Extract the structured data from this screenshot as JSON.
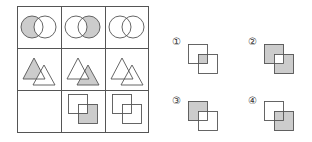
{
  "puzzle": {
    "description": "3x3 figure reasoning grid with four answer options",
    "grid": {
      "rows": 3,
      "cols": 3,
      "cells": [
        {
          "row": 1,
          "col": 1,
          "shape": "circles",
          "shaded": "left-minus-overlap"
        },
        {
          "row": 1,
          "col": 2,
          "shape": "circles",
          "shaded": "right-minus-overlap"
        },
        {
          "row": 1,
          "col": 3,
          "shape": "circles",
          "shaded": "none"
        },
        {
          "row": 2,
          "col": 1,
          "shape": "triangles",
          "shaded": "left-minus-overlap"
        },
        {
          "row": 2,
          "col": 2,
          "shape": "triangles",
          "shaded": "right-minus-overlap"
        },
        {
          "row": 2,
          "col": 3,
          "shape": "triangles",
          "shaded": "none"
        },
        {
          "row": 3,
          "col": 1,
          "shape": "blank",
          "shaded": "none"
        },
        {
          "row": 3,
          "col": 2,
          "shape": "squares",
          "shaded": "bottom-right-minus-overlap"
        },
        {
          "row": 3,
          "col": 3,
          "shape": "squares",
          "shaded": "none"
        }
      ]
    },
    "options": [
      {
        "label": "①",
        "shape": "squares",
        "shaded": "overlap-only"
      },
      {
        "label": "②",
        "shape": "squares",
        "shaded": "both-minus-overlap"
      },
      {
        "label": "③",
        "shape": "squares",
        "shaded": "top-left-minus-overlap"
      },
      {
        "label": "④",
        "shape": "squares",
        "shaded": "bottom-right-full"
      }
    ],
    "colors": {
      "line": "#555555",
      "fill": "#cccccc",
      "background": "#ffffff"
    }
  }
}
